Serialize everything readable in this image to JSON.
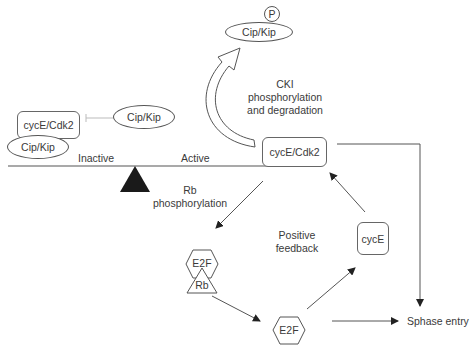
{
  "diagram": {
    "title": "",
    "nodes": {
      "cip_kip_phospho": "Cip/Kip",
      "phospho_marker": "P",
      "cip_kip_free": "Cip/Kip",
      "cyce_cdk2_inactive": "cycE/Cdk2",
      "cip_kip_bound": "Cip/Kip",
      "cyce_cdk2_active": "cycE/Cdk2",
      "e2f_rb_e2f": "E2F",
      "e2f_rb_rb": "Rb",
      "e2f_free": "E2F",
      "cyce": "cycE",
      "sphase_entry": "Sphase entry"
    },
    "labels": {
      "inactive": "Inactive",
      "active": "Active",
      "cki_line1": "CKI",
      "cki_line2": "phosphorylation",
      "cki_line3": "and degradation",
      "rb_line1": "Rb",
      "rb_line2": "phosphorylation",
      "feedback_line1": "Positive",
      "feedback_line2": "feedback"
    },
    "edges": [
      {
        "from": "cip_kip_free",
        "to": "cyce_cdk2_inactive",
        "type": "inhibition"
      },
      {
        "from": "cyce_cdk2_active",
        "to": "cip_kip_phospho",
        "type": "curved-arrow",
        "label": "CKI phosphorylation and degradation"
      },
      {
        "from": "cyce_cdk2_active",
        "to": "e2f_rb",
        "type": "arrow",
        "label": "Rb phosphorylation"
      },
      {
        "from": "e2f_rb",
        "to": "e2f_free",
        "type": "arrow"
      },
      {
        "from": "e2f_free",
        "to": "cyce",
        "type": "arrow"
      },
      {
        "from": "cyce",
        "to": "cyce_cdk2_active",
        "type": "arrow"
      },
      {
        "from": "e2f_free",
        "to": "sphase_entry",
        "type": "arrow"
      },
      {
        "from": "cyce_cdk2_active",
        "to": "sphase_entry",
        "type": "elbow-arrow"
      }
    ],
    "colors": {
      "stroke": "#555555",
      "fulcrum": "#1a1a1a",
      "inhibition": "#bbbbbb",
      "text": "#3a3a3a"
    }
  }
}
